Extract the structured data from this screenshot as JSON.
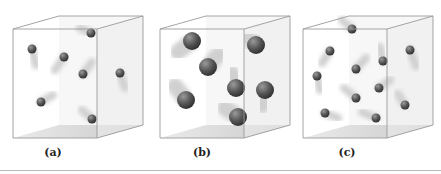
{
  "figure": {
    "panels": [
      {
        "id": "a",
        "label": "(a)",
        "description": "Cube containing 7 small gas molecules with motion trails",
        "cube": {
          "ox": 13,
          "oy": 29,
          "w": 84,
          "h": 109,
          "dx": 46,
          "dy": -13
        },
        "molecules": [
          {
            "x": 91,
            "y": 33,
            "r": 4.5,
            "tx": 80,
            "ty": 28
          },
          {
            "x": 32,
            "y": 49,
            "r": 4.5,
            "tx": 36,
            "ty": 65
          },
          {
            "x": 64,
            "y": 57,
            "r": 4.5,
            "tx": 55,
            "ty": 70
          },
          {
            "x": 83,
            "y": 74,
            "r": 4.5,
            "tx": 92,
            "ty": 62
          },
          {
            "x": 120,
            "y": 73,
            "r": 4.5,
            "tx": 125,
            "ty": 88
          },
          {
            "x": 41,
            "y": 102,
            "r": 4.5,
            "tx": 53,
            "ty": 95
          },
          {
            "x": 92,
            "y": 119,
            "r": 4.5,
            "tx": 82,
            "ty": 110
          }
        ]
      },
      {
        "id": "b",
        "label": "(b)",
        "description": "Cube containing 7 large gas molecules with motion trails",
        "cube": {
          "ox": 160,
          "oy": 29,
          "w": 84,
          "h": 109,
          "dx": 46,
          "dy": -13
        },
        "molecules": [
          {
            "x": 192,
            "y": 41,
            "r": 9,
            "tx": 178,
            "ty": 52
          },
          {
            "x": 256,
            "y": 45,
            "r": 9,
            "tx": 248,
            "ty": 38
          },
          {
            "x": 208,
            "y": 67,
            "r": 9,
            "tx": 218,
            "ty": 55
          },
          {
            "x": 236,
            "y": 88,
            "r": 9,
            "tx": 232,
            "ty": 74
          },
          {
            "x": 265,
            "y": 90,
            "r": 9,
            "tx": 262,
            "ty": 105
          },
          {
            "x": 186,
            "y": 100,
            "r": 9,
            "tx": 175,
            "ty": 86
          },
          {
            "x": 238,
            "y": 117,
            "r": 9,
            "tx": 225,
            "ty": 108
          }
        ]
      },
      {
        "id": "c",
        "label": "(c)",
        "description": "Cube containing 11 small gas molecules with motion trails",
        "cube": {
          "ox": 303,
          "oy": 29,
          "w": 84,
          "h": 109,
          "dx": 46,
          "dy": -13
        },
        "molecules": [
          {
            "x": 352,
            "y": 29,
            "r": 4.5,
            "tx": 342,
            "ty": 20
          },
          {
            "x": 330,
            "y": 51,
            "r": 4.5,
            "tx": 322,
            "ty": 63
          },
          {
            "x": 410,
            "y": 50,
            "r": 4.5,
            "tx": 416,
            "ty": 66
          },
          {
            "x": 383,
            "y": 61,
            "r": 4.5,
            "tx": 380,
            "ty": 47
          },
          {
            "x": 356,
            "y": 69,
            "r": 4.5,
            "tx": 366,
            "ty": 58
          },
          {
            "x": 317,
            "y": 76,
            "r": 4.5,
            "tx": 320,
            "ty": 90
          },
          {
            "x": 379,
            "y": 88,
            "r": 4.5,
            "tx": 390,
            "ty": 80
          },
          {
            "x": 356,
            "y": 98,
            "r": 4.5,
            "tx": 344,
            "ty": 88
          },
          {
            "x": 405,
            "y": 105,
            "r": 4.5,
            "tx": 398,
            "ty": 94
          },
          {
            "x": 325,
            "y": 113,
            "r": 4.5,
            "tx": 338,
            "ty": 118
          },
          {
            "x": 376,
            "y": 118,
            "r": 4.5,
            "tx": 362,
            "ty": 112
          }
        ]
      }
    ]
  },
  "colors": {
    "edge": "#9a9a9a",
    "floor": "#b8b8b8",
    "molecule": "#555555",
    "highlight": "#9a9a9a",
    "trail": "#d0d0d0",
    "separator": "#bbbbbb"
  }
}
